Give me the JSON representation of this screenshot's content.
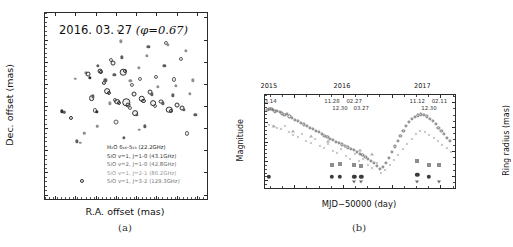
{
  "figure": {
    "panel_a_label": "(a)",
    "panel_b_label": "(b)"
  },
  "panel_a": {
    "title_date": "2016. 03. 27",
    "title_phase": "(φ=0.67)",
    "xlabel": "R.A. offset (mas)",
    "ylabel": "Dec. offset (mas)",
    "xticks": [
      "150",
      "100",
      "50",
      "0",
      "-50",
      "-100",
      "-150",
      "-200"
    ],
    "yticks": [
      "150",
      "100",
      "50",
      "0",
      "-50",
      "-100",
      "-150",
      "-200",
      "-250"
    ],
    "xlim": [
      175,
      -225
    ],
    "ylim": [
      -260,
      160
    ],
    "legend": [
      {
        "text": "H₂O 6₁₆-5₂₃ (22.2GHz)",
        "color": "#1c1c1c"
      },
      {
        "text": "SiO v=1, J=1-0 (43.1GHz)",
        "color": "#3a3a3a"
      },
      {
        "text": "SiO v=2, J=1-0 (42.8GHz)",
        "color": "#6b6b6b"
      },
      {
        "text": "SiO v=1, J=2-1 (86.2GHz)",
        "color": "#9a9a9a"
      },
      {
        "text": "SiO v=1, J=3-2 (129.3GHz)",
        "color": "#757575"
      }
    ]
  },
  "panel_b": {
    "xlabel": "MJD−50000 (day)",
    "ylabel_left": "Magnitude",
    "ylabel_right": "Ring radius (mas)",
    "xticks": [
      "7200",
      "7400",
      "7600",
      "7800"
    ],
    "yticks_left": [
      "8",
      "9",
      "10",
      "11",
      "12"
    ],
    "yticks_right": [
      "20",
      "18",
      "16",
      "14"
    ],
    "xlim": [
      7080,
      7860
    ],
    "ylim_left": [
      12.4,
      7.6
    ],
    "ylim_right": [
      13.0,
      20.6
    ],
    "year_labels": [
      {
        "text": "2015",
        "x": 7100
      },
      {
        "text": "2016",
        "x": 7400
      },
      {
        "text": "2017",
        "x": 7730
      }
    ],
    "date_labels": [
      {
        "text": "03.14",
        "x": 7096,
        "row": 0
      },
      {
        "text": "11.28",
        "x": 7355,
        "row": 0
      },
      {
        "text": "12.30",
        "x": 7388,
        "row": 1
      },
      {
        "text": "02.27",
        "x": 7446,
        "row": 0
      },
      {
        "text": "03.27",
        "x": 7475,
        "row": 1
      },
      {
        "text": "11.12",
        "x": 7705,
        "row": 0
      },
      {
        "text": "12.30",
        "x": 7753,
        "row": 1
      },
      {
        "text": "02.11",
        "x": 7796,
        "row": 0
      }
    ]
  },
  "chart_data": [
    {
      "type": "scatter",
      "title": "2016. 03. 27 (φ=0.67)",
      "xlabel": "R.A. offset (mas)",
      "ylabel": "Dec. offset (mas)",
      "xlim": [
        175,
        -225
      ],
      "ylim": [
        -260,
        160
      ],
      "legend": [
        "H₂O 6₁₆-5₂₃ (22.2GHz)",
        "SiO v=1, J=1-0 (43.1GHz)",
        "SiO v=2, J=1-0 (42.8GHz)",
        "SiO v=1, J=2-1 (86.2GHz)",
        "SiO v=1, J=3-2 (129.3GHz)"
      ],
      "note": "maser spot contour map; x,y in mas, r = apparent blob radius (mas), g = gray level 0-4 keyed to legend order",
      "points": [
        {
          "x": 133,
          "y": -62,
          "r": 4,
          "g": 1
        },
        {
          "x": 127,
          "y": -64,
          "r": 3,
          "g": 2
        },
        {
          "x": 112,
          "y": -78,
          "r": 5,
          "g": 1
        },
        {
          "x": 96,
          "y": -130,
          "r": 4,
          "g": 2
        },
        {
          "x": 88,
          "y": -133,
          "r": 3,
          "g": 3
        },
        {
          "x": 84,
          "y": -220,
          "r": 5,
          "g": 1
        },
        {
          "x": 74,
          "y": 24,
          "r": 4,
          "g": 3
        },
        {
          "x": 68,
          "y": 22,
          "r": 6,
          "g": 1
        },
        {
          "x": 64,
          "y": 14,
          "r": 4,
          "g": 1
        },
        {
          "x": 60,
          "y": -32,
          "r": 7,
          "g": 1
        },
        {
          "x": 56,
          "y": -28,
          "r": 4,
          "g": 2
        },
        {
          "x": 52,
          "y": -60,
          "r": 5,
          "g": 2
        },
        {
          "x": 47,
          "y": -64,
          "r": 4,
          "g": 1
        },
        {
          "x": 44,
          "y": 40,
          "r": 4,
          "g": 2
        },
        {
          "x": 40,
          "y": 28,
          "r": 6,
          "g": 1
        },
        {
          "x": 36,
          "y": 26,
          "r": 5,
          "g": 1
        },
        {
          "x": 30,
          "y": 2,
          "r": 5,
          "g": 1
        },
        {
          "x": 26,
          "y": 8,
          "r": 4,
          "g": 2
        },
        {
          "x": 22,
          "y": -16,
          "r": 7,
          "g": 1
        },
        {
          "x": 18,
          "y": -20,
          "r": 5,
          "g": 1
        },
        {
          "x": 14,
          "y": -44,
          "r": 4,
          "g": 3
        },
        {
          "x": 12,
          "y": 54,
          "r": 5,
          "g": 2
        },
        {
          "x": 8,
          "y": 48,
          "r": 6,
          "g": 1
        },
        {
          "x": 4,
          "y": 20,
          "r": 4,
          "g": 2
        },
        {
          "x": 2,
          "y": -36,
          "r": 5,
          "g": 2
        },
        {
          "x": 0,
          "y": -86,
          "r": 6,
          "g": 2
        },
        {
          "x": -4,
          "y": -40,
          "r": 7,
          "g": 1
        },
        {
          "x": -8,
          "y": -44,
          "r": 5,
          "g": 1
        },
        {
          "x": -12,
          "y": 96,
          "r": 4,
          "g": 3
        },
        {
          "x": -14,
          "y": 60,
          "r": 4,
          "g": 2
        },
        {
          "x": -18,
          "y": 26,
          "r": 8,
          "g": 1
        },
        {
          "x": -22,
          "y": 30,
          "r": 5,
          "g": 1
        },
        {
          "x": -26,
          "y": -42,
          "r": 9,
          "g": 1
        },
        {
          "x": -30,
          "y": -48,
          "r": 6,
          "g": 1
        },
        {
          "x": -34,
          "y": -54,
          "r": 5,
          "g": 2
        },
        {
          "x": -36,
          "y": 6,
          "r": 4,
          "g": 3
        },
        {
          "x": -40,
          "y": -2,
          "r": 5,
          "g": 2
        },
        {
          "x": -44,
          "y": -22,
          "r": 6,
          "g": 1
        },
        {
          "x": -48,
          "y": -66,
          "r": 7,
          "g": 1
        },
        {
          "x": -52,
          "y": -70,
          "r": 4,
          "g": 2
        },
        {
          "x": -56,
          "y": 36,
          "r": 4,
          "g": 3
        },
        {
          "x": -60,
          "y": 12,
          "r": 5,
          "g": 2
        },
        {
          "x": -64,
          "y": -34,
          "r": 8,
          "g": 1
        },
        {
          "x": -68,
          "y": -38,
          "r": 5,
          "g": 1
        },
        {
          "x": -72,
          "y": -96,
          "r": 4,
          "g": 2
        },
        {
          "x": -76,
          "y": 64,
          "r": 4,
          "g": 3
        },
        {
          "x": -80,
          "y": 84,
          "r": 4,
          "g": 2
        },
        {
          "x": -84,
          "y": -18,
          "r": 6,
          "g": 1
        },
        {
          "x": -88,
          "y": -24,
          "r": 4,
          "g": 2
        },
        {
          "x": -92,
          "y": -44,
          "r": 7,
          "g": 1
        },
        {
          "x": -96,
          "y": -50,
          "r": 5,
          "g": 2
        },
        {
          "x": -100,
          "y": 16,
          "r": 5,
          "g": 2
        },
        {
          "x": -104,
          "y": -6,
          "r": 4,
          "g": 3
        },
        {
          "x": -112,
          "y": -40,
          "r": 6,
          "g": 1
        },
        {
          "x": -116,
          "y": -44,
          "r": 4,
          "g": 2
        },
        {
          "x": -120,
          "y": 40,
          "r": 4,
          "g": 2
        },
        {
          "x": -124,
          "y": 92,
          "r": 5,
          "g": 2
        },
        {
          "x": -128,
          "y": 88,
          "r": 4,
          "g": 3
        },
        {
          "x": -132,
          "y": -58,
          "r": 8,
          "g": 1
        },
        {
          "x": -136,
          "y": -62,
          "r": 5,
          "g": 1
        },
        {
          "x": -140,
          "y": -26,
          "r": 4,
          "g": 2
        },
        {
          "x": -144,
          "y": 10,
          "r": 5,
          "g": 2
        },
        {
          "x": -148,
          "y": -4,
          "r": 4,
          "g": 3
        },
        {
          "x": -152,
          "y": -48,
          "r": 6,
          "g": 1
        },
        {
          "x": -160,
          "y": 56,
          "r": 5,
          "g": 2
        },
        {
          "x": -164,
          "y": -54,
          "r": 6,
          "g": 1
        },
        {
          "x": -168,
          "y": -58,
          "r": 4,
          "g": 2
        },
        {
          "x": -172,
          "y": 74,
          "r": 4,
          "g": 3
        },
        {
          "x": -176,
          "y": -112,
          "r": 5,
          "g": 2
        },
        {
          "x": -182,
          "y": -22,
          "r": 4,
          "g": 3
        },
        {
          "x": -190,
          "y": 8,
          "r": 4,
          "g": 3
        },
        {
          "x": -196,
          "y": -70,
          "r": 4,
          "g": 2
        },
        {
          "x": 100,
          "y": 12,
          "r": 3,
          "g": 3
        },
        {
          "x": 78,
          "y": -112,
          "r": 3,
          "g": 3
        },
        {
          "x": -6,
          "y": 120,
          "r": 3,
          "g": 3
        },
        {
          "x": 46,
          "y": -96,
          "r": 3,
          "g": 3
        },
        {
          "x": -58,
          "y": -104,
          "r": 3,
          "g": 3
        },
        {
          "x": -20,
          "y": -122,
          "r": 4,
          "g": 2
        }
      ]
    },
    {
      "type": "scatter",
      "xlabel": "MJD−50000 (day)",
      "ylabel": "Magnitude",
      "ylabel_secondary": "Ring radius (mas)",
      "xlim": [
        7080,
        7860
      ],
      "ylim": [
        12.4,
        7.6
      ],
      "ylim_secondary": [
        13.0,
        20.6
      ],
      "axis_inverted_y": true,
      "series": [
        {
          "name": "Visual light curve (open circles)",
          "marker": "open-circle",
          "axis": "left",
          "x": [
            7090,
            7098,
            7106,
            7114,
            7122,
            7130,
            7140,
            7150,
            7160,
            7170,
            7180,
            7192,
            7204,
            7216,
            7228,
            7240,
            7252,
            7264,
            7276,
            7288,
            7300,
            7312,
            7324,
            7336,
            7348,
            7360,
            7372,
            7384,
            7396,
            7408,
            7420,
            7432,
            7444,
            7456,
            7468,
            7480,
            7492,
            7504,
            7516,
            7528,
            7540,
            7552,
            7564,
            7576,
            7588,
            7600,
            7612,
            7624,
            7636,
            7648,
            7660,
            7672,
            7684,
            7696,
            7708,
            7720,
            7732,
            7744,
            7756,
            7768,
            7780,
            7792,
            7804,
            7816,
            7828,
            7840
          ],
          "y": [
            8.35,
            8.3,
            8.32,
            8.38,
            8.45,
            8.4,
            8.48,
            8.55,
            8.62,
            8.58,
            8.7,
            8.8,
            8.88,
            8.95,
            9.05,
            9.12,
            9.2,
            9.28,
            9.35,
            9.45,
            9.52,
            9.6,
            9.7,
            9.78,
            9.85,
            9.92,
            10.0,
            10.08,
            10.15,
            10.22,
            10.3,
            10.38,
            10.45,
            10.55,
            10.62,
            10.7,
            10.8,
            10.9,
            11.0,
            11.12,
            11.25,
            11.4,
            11.3,
            11.1,
            10.85,
            10.55,
            10.25,
            9.95,
            9.7,
            9.45,
            9.2,
            9.0,
            8.85,
            8.72,
            8.65,
            8.6,
            8.62,
            8.7,
            8.82,
            8.95,
            9.1,
            9.28,
            9.45,
            9.62,
            9.8,
            9.95
          ]
        },
        {
          "name": "Photometry (gray crosses / dots)",
          "marker": "cross",
          "axis": "left",
          "x": [
            7095,
            7112,
            7128,
            7145,
            7162,
            7178,
            7196,
            7214,
            7232,
            7250,
            7268,
            7286,
            7304,
            7322,
            7340,
            7358,
            7376,
            7394,
            7412,
            7430,
            7448,
            7466,
            7484,
            7502,
            7520,
            7538,
            7556,
            7574,
            7592,
            7610,
            7628,
            7646,
            7664,
            7682,
            7700,
            7718,
            7736,
            7754,
            7772,
            7790,
            7808,
            7826,
            7844
          ],
          "y": [
            8.55,
            8.62,
            8.7,
            8.78,
            8.6,
            8.92,
            9.05,
            9.18,
            9.0,
            9.35,
            9.48,
            9.25,
            9.62,
            9.75,
            9.55,
            9.88,
            10.02,
            9.8,
            10.15,
            10.28,
            10.05,
            10.42,
            10.3,
            10.62,
            10.78,
            10.5,
            11.02,
            10.88,
            10.62,
            10.35,
            10.08,
            9.8,
            9.52,
            9.25,
            9.02,
            8.85,
            8.92,
            9.05,
            9.22,
            9.4,
            9.58,
            9.75,
            9.92
          ]
        },
        {
          "name": "Ring radius (filled squares)",
          "marker": "filled-square",
          "axis": "right",
          "x": [
            7355,
            7388,
            7446,
            7475,
            7705,
            7753,
            7796
          ],
          "y": [
            14.9,
            15.0,
            14.9,
            14.8,
            15.2,
            14.9,
            14.9
          ]
        },
        {
          "name": "Ring radius (filled circles)",
          "marker": "filled-circle",
          "axis": "right",
          "x": [
            7096,
            7355,
            7388,
            7446,
            7475,
            7705,
            7753
          ],
          "y": [
            13.9,
            13.9,
            13.9,
            13.9,
            13.9,
            14.1,
            13.9
          ]
        },
        {
          "name": "Upper limits (down triangles)",
          "marker": "down-triangle",
          "axis": "right",
          "x": [
            7446,
            7475,
            7705,
            7796
          ],
          "y": [
            13.5,
            13.5,
            13.5,
            13.5
          ]
        },
        {
          "name": "Gray triangles (sparse)",
          "marker": "up-triangle",
          "axis": "left",
          "x": [
            7118,
            7196,
            7268,
            7340,
            7412,
            7468,
            7520
          ],
          "y": [
            9.2,
            9.45,
            9.72,
            9.95,
            10.25,
            10.45,
            10.65
          ]
        }
      ]
    }
  ]
}
